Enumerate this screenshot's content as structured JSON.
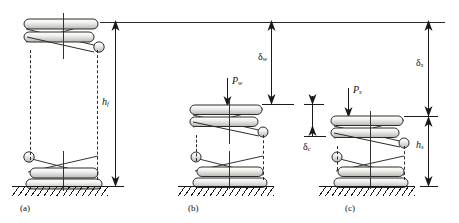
{
  "figure": {
    "background": "#ffffff",
    "ink_color": "#1a1a1a",
    "width": 459,
    "height": 223
  },
  "panels": [
    {
      "id": "a",
      "caption": "(a)",
      "state": "free length",
      "load_label": "",
      "height_label": "h",
      "height_sub": "f"
    },
    {
      "id": "b",
      "caption": "(b)",
      "state": "working load",
      "load_label": "P",
      "load_sub": "w",
      "deflection_label": "δ",
      "deflection_sub": "w"
    },
    {
      "id": "c",
      "caption": "(c)",
      "state": "solid / shut height",
      "load_label": "P",
      "load_sub": "s",
      "deflection_label": "δ",
      "deflection_sub": "s",
      "height_label": "h",
      "height_sub": "s"
    }
  ],
  "dimensions": [
    {
      "name": "free-height",
      "symbol": "h",
      "subscript": "f",
      "panel": "a"
    },
    {
      "name": "working-deflection",
      "symbol": "δ",
      "subscript": "w",
      "panel": "b"
    },
    {
      "name": "clash-allowance",
      "symbol": "δ",
      "subscript": "c",
      "panel": "b-c"
    },
    {
      "name": "solid-deflection",
      "symbol": "δ",
      "subscript": "s",
      "panel": "c"
    },
    {
      "name": "solid-height",
      "symbol": "h",
      "subscript": "s",
      "panel": "c"
    }
  ],
  "forces": [
    {
      "name": "working-load",
      "symbol": "P",
      "subscript": "w",
      "panel": "b",
      "direction": "down"
    },
    {
      "name": "solid-load",
      "symbol": "P",
      "subscript": "s",
      "panel": "c",
      "direction": "down"
    }
  ],
  "labels": {
    "h_f": {
      "base": "h",
      "sub": "f"
    },
    "delta_w": {
      "base": "δ",
      "sub": "w"
    },
    "delta_c": {
      "base": "δ",
      "sub": "c"
    },
    "delta_s": {
      "base": "δ",
      "sub": "s"
    },
    "h_s": {
      "base": "h",
      "sub": "s"
    },
    "P_w": {
      "base": "P",
      "sub": "w"
    },
    "P_s": {
      "base": "P",
      "sub": "s"
    },
    "caption_a": "(a)",
    "caption_b": "(b)",
    "caption_c": "(c)"
  }
}
